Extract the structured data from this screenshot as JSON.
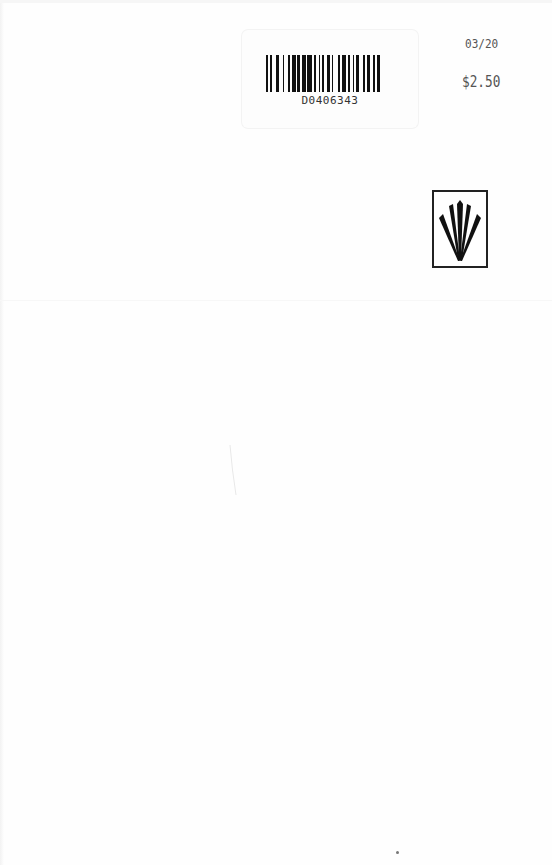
{
  "document": {
    "type": "book-back-cover",
    "barcode_sticker": {
      "code": "D0406343"
    },
    "date_tag": "03/20",
    "price_tag": "$2.50",
    "publisher_logo": {
      "icon": "fan-burst-logo-icon"
    }
  },
  "colors": {
    "background": "#fefefe",
    "ink": "#111111",
    "stamp_ink": "#555555"
  }
}
